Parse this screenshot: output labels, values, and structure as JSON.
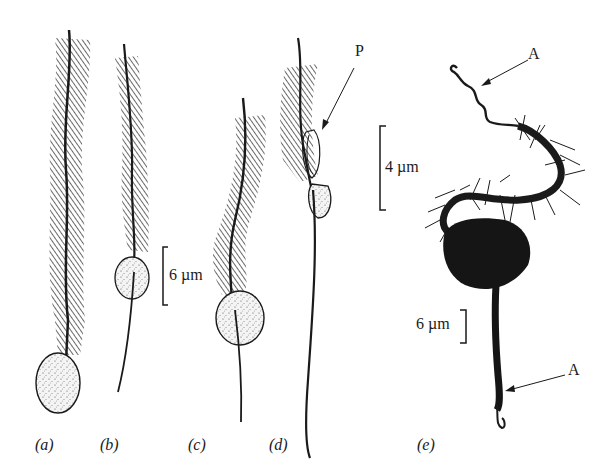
{
  "figure": {
    "panels": [
      {
        "id": "a",
        "label": "(a)"
      },
      {
        "id": "b",
        "label": "(b)"
      },
      {
        "id": "c",
        "label": "(c)"
      },
      {
        "id": "d",
        "label": "(d)"
      },
      {
        "id": "e",
        "label": "(e)"
      }
    ],
    "scale_bars": [
      {
        "id": "scale-6um-bc",
        "text": "6 µm"
      },
      {
        "id": "scale-4um",
        "text": "4 µm"
      },
      {
        "id": "scale-6um-e",
        "text": "6 µm"
      }
    ],
    "annotations": [
      {
        "id": "P",
        "text": "P"
      },
      {
        "id": "A-top",
        "text": "A"
      },
      {
        "id": "A-bottom",
        "text": "A"
      }
    ],
    "colors": {
      "ink": "#1a1a1a",
      "stipple": "#f2f2f2",
      "background": "#ffffff"
    }
  }
}
